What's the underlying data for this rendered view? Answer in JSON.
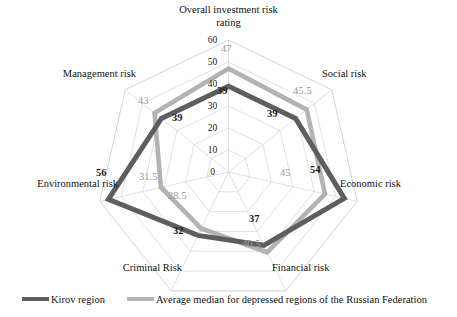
{
  "chart_data": {
    "type": "radar",
    "title": "",
    "categories": [
      "Overall investment risk rating",
      "Social risk",
      "Economic risk",
      "Financial risk",
      "Criminal Risk",
      "Environmental risk",
      "Management risk"
    ],
    "series": [
      {
        "name": "Kirov region",
        "color": "#5e5e5e",
        "values": [
          39,
          39,
          54,
          37,
          32,
          56,
          39
        ]
      },
      {
        "name": "Average median for depressed regions of the Russian Federation",
        "color": "#b3b3b3",
        "values": [
          47,
          45.5,
          45,
          40.5,
          28.5,
          31.5,
          43
        ]
      }
    ],
    "radial_ticks": [
      0,
      10,
      20,
      30,
      40,
      50,
      60
    ],
    "rlim": [
      0,
      60
    ],
    "grid": true,
    "legend_position": "bottom",
    "xlabel": "",
    "ylabel": ""
  },
  "axis_tick_labels": [
    "0",
    "10",
    "20",
    "30",
    "40",
    "50",
    "60"
  ],
  "category_labels": [
    {
      "line1": "Overall investment risk",
      "line2": "rating"
    },
    {
      "line1": "Social risk",
      "line2": ""
    },
    {
      "line1": "Economic risk",
      "line2": ""
    },
    {
      "line1": "Financial risk",
      "line2": ""
    },
    {
      "line1": "Criminal Risk",
      "line2": ""
    },
    {
      "line1": "Environmental risk",
      "line2": ""
    },
    {
      "line1": "Management risk",
      "line2": ""
    }
  ],
  "value_labels": {
    "primary": [
      "39",
      "39",
      "54",
      "37",
      "32",
      "56",
      "39"
    ],
    "secondary": [
      "47",
      "45.5",
      "45",
      "40.5",
      "28.5",
      "31.5",
      "43"
    ]
  },
  "legend": {
    "entries": [
      {
        "label": "Kirov region",
        "color": "#5e5e5e"
      },
      {
        "label": "Average median for depressed regions of the Russian Federation",
        "color": "#b3b3b3"
      }
    ]
  },
  "colors": {
    "series_primary": "#5e5e5e",
    "series_secondary": "#b3b3b3",
    "grid": "#d2d2d2",
    "text": "#111111",
    "background": "#ffffff"
  }
}
